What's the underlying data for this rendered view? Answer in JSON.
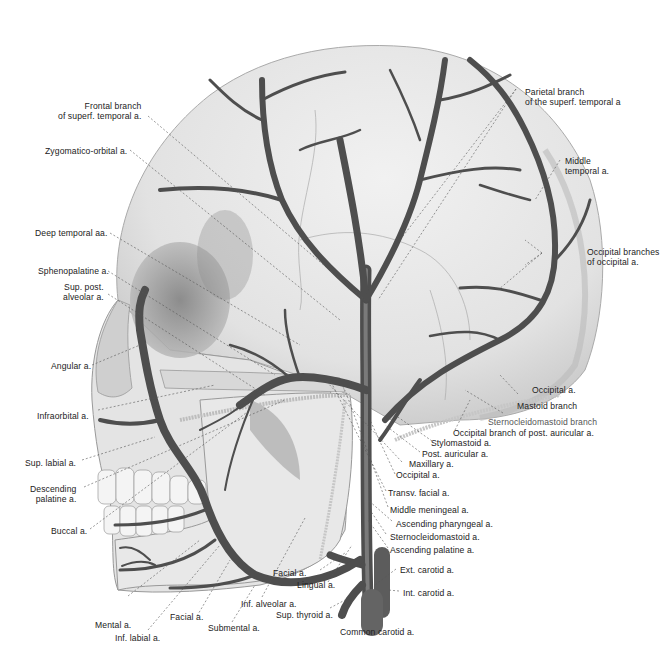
{
  "figure": {
    "colors": {
      "skull": "#e6e6e6",
      "skull_shadow": "#9a9a9a",
      "artery": "#5a5a5a",
      "artery_dark": "#2e2e2e",
      "label": "#222222",
      "leader": "#555555"
    }
  },
  "labels": {
    "frontal_branch": [
      "Frontal branch",
      "of superf. temporal a."
    ],
    "zygomatico_orbital": "Zygomatico-orbital a.",
    "deep_temporal": "Deep temporal aa.",
    "sphenopalatine": "Sphenopalatine a.",
    "sup_post_alveolar": [
      "Sup. post.",
      "alveolar a."
    ],
    "angular": "Angular a.",
    "infraorbital": "Infraorbital a.",
    "sup_labial": "Sup. labial a.",
    "descending_palatine": [
      "Descending",
      "palatine a."
    ],
    "buccal": "Buccal a.",
    "mental": "Mental a.",
    "inf_labial": "Inf. labial a.",
    "facial_lower": "Facial a.",
    "submental": "Submental a.",
    "inf_alveolar": "Inf. alveolar a.",
    "facial_upper": "Facial a.",
    "lingual": "Lingual a.",
    "sup_thyroid": "Sup. thyroid a.",
    "common_carotid": "Common carotid a.",
    "int_carotid": "Int. carotid a.",
    "ext_carotid": "Ext. carotid a.",
    "ascending_palatine": "Ascending palatine a.",
    "sternocleidomastoid_a": "Sternocleidomastoid a.",
    "ascending_pharyngeal": "Ascending pharyngeal a.",
    "middle_meningeal": "Middle meningeal a.",
    "transv_facial": "Transv. facial a.",
    "occipital_lower": "Occipital a.",
    "maxillary": "Maxillary a.",
    "post_auricular": "Post. auricular a.",
    "stylomastoid": "Stylomastoid a.",
    "occipital_branch_post_auricular": "Occipital branch of post. auricular a.",
    "sternocleidomastoid_branch": "Sternocleidomastoid branch",
    "mastoid_branch": "Mastoid branch",
    "occipital_upper": "Occipital a.",
    "occipital_branches": [
      "Occipital branches",
      "of occipital a."
    ],
    "middle_temporal": [
      "Middle",
      "temporal a."
    ],
    "parietal_branch": [
      "Parietal branch",
      "of the superf. temporal a"
    ]
  }
}
